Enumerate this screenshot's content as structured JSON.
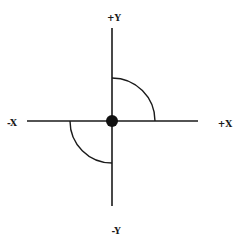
{
  "diagram": {
    "type": "coordinate-axes",
    "labels": {
      "pos_y": "+Y",
      "neg_y": "-Y",
      "neg_x": "-X",
      "pos_x": "+X"
    },
    "origin": {
      "x": 112,
      "y": 121,
      "marker": "filled-circle"
    },
    "arcs": [
      {
        "quadrant": "upper-right",
        "from": "+Y",
        "to": "+X"
      },
      {
        "quadrant": "lower-left",
        "from": "-X",
        "to": "-Y"
      }
    ],
    "colors": {
      "line": "#1a1a1a",
      "background": "#ffffff"
    }
  }
}
